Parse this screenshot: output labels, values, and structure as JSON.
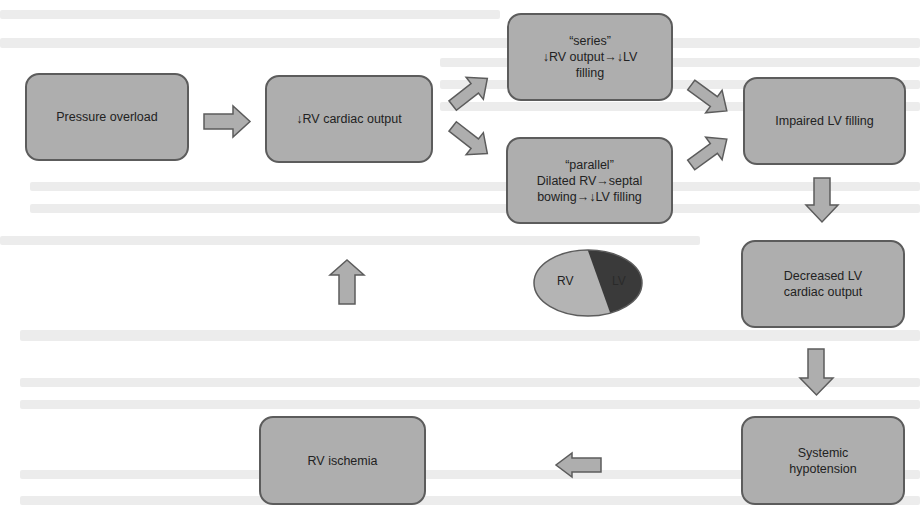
{
  "diagram": {
    "colors": {
      "box_fill": "#aeaeae",
      "box_border": "#5c5c5c",
      "rv_fill": "#b4b4b4",
      "lv_fill": "#3a3a3a",
      "text": "#222222"
    },
    "nodes": {
      "pressure_overload": "Pressure overload",
      "rv_cardiac_output": "↓RV cardiac output",
      "series": "“series”\n↓RV output→↓LV\nfilling",
      "parallel": "“parallel”\nDilated RV→septal\nbowing→↓LV filling",
      "impaired_lv_filling": "Impaired LV filling",
      "decreased_lv_output": "Decreased LV\ncardiac output",
      "systemic_hypotension": "Systemic\nhypotension",
      "rv_ischemia": "RV ischemia"
    },
    "heart": {
      "rv_label": "RV",
      "lv_label": "LV"
    },
    "edges": [
      {
        "from": "pressure_overload",
        "to": "rv_cardiac_output"
      },
      {
        "from": "rv_cardiac_output",
        "to": "series"
      },
      {
        "from": "rv_cardiac_output",
        "to": "parallel"
      },
      {
        "from": "series",
        "to": "impaired_lv_filling"
      },
      {
        "from": "parallel",
        "to": "impaired_lv_filling"
      },
      {
        "from": "impaired_lv_filling",
        "to": "decreased_lv_output"
      },
      {
        "from": "decreased_lv_output",
        "to": "systemic_hypotension"
      },
      {
        "from": "systemic_hypotension",
        "to": "rv_ischemia"
      },
      {
        "from": "rv_ischemia",
        "to": "rv_cardiac_output"
      }
    ]
  }
}
